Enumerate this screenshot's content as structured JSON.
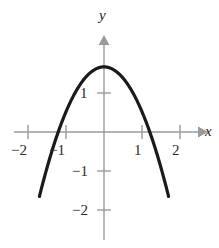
{
  "figure": {
    "type": "graph",
    "background_color": "#ffffff",
    "axis_color": "#9a9a9a",
    "curve_color": "#1a1a1a",
    "label_color": "#2b2b2b"
  },
  "axes": {
    "x_axis_label": "x",
    "y_axis_label": "y",
    "x_ticks": [
      {
        "value": -2,
        "label": "−2"
      },
      {
        "value": -1,
        "label": "−1"
      },
      {
        "value": 1,
        "label": "1"
      },
      {
        "value": 2,
        "label": "2"
      }
    ],
    "y_ticks": [
      {
        "value": 1,
        "label": "1"
      },
      {
        "value": -1,
        "label": "−1"
      },
      {
        "value": -2,
        "label": "−2"
      }
    ],
    "origin_px": {
      "x": 104,
      "y": 132
    },
    "unit_px": {
      "x": 38,
      "y": 39
    },
    "x_range": [
      -2.7,
      2.5
    ],
    "y_range": [
      -2.9,
      2.4
    ],
    "grid": false
  },
  "chart_data": {
    "type": "line",
    "title": "",
    "xlabel": "x",
    "ylabel": "y",
    "xlim": [
      -2.7,
      2.5
    ],
    "ylim": [
      -2.9,
      2.4
    ],
    "grid": false,
    "legend": null,
    "series": [
      {
        "name": "parabola",
        "equation": "y = -1.15x^2 + 1.67",
        "vertex": [
          0,
          1.67
        ],
        "x_intercepts": [
          -1.21,
          1.21
        ],
        "y_intercept": 1.67,
        "opens": "down",
        "x": [
          -1.62,
          -1.4,
          -1.2,
          -1.0,
          -0.8,
          -0.6,
          -0.4,
          -0.2,
          0,
          0.2,
          0.4,
          0.6,
          0.8,
          1.0,
          1.2,
          1.4,
          1.62
        ],
        "y": [
          -1.35,
          -0.58,
          0.01,
          0.52,
          0.93,
          1.26,
          1.49,
          1.62,
          1.67,
          1.62,
          1.49,
          1.26,
          0.93,
          0.52,
          0.01,
          -0.58,
          -1.35
        ]
      }
    ]
  },
  "polyline_points": "56.4,185.1 63.0,170.0 70.4,152.4 78.0,136.7 85.6,123.0 93.2,111.2 100.8,101.4 104.0,97.9 107.2,101.4 114.8,111.2 122.4,123.0 130.0,136.7 137.6,152.4 145.0,170.0 151.6,185.1 158.0,201.0 163.0,215.0 167.2,228.0 170.0,238.0"
}
